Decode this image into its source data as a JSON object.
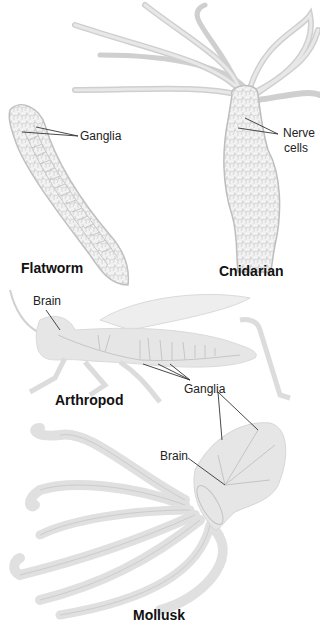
{
  "organisms": [
    {
      "name": "Flatworm",
      "labels": [
        "Ganglia"
      ]
    },
    {
      "name": "Cnidarian",
      "labels": [
        "Nerve",
        "cells"
      ]
    },
    {
      "name": "Arthropod",
      "labels": [
        "Brain",
        "Ganglia"
      ]
    },
    {
      "name": "Mollusk",
      "labels": [
        "Brain"
      ]
    }
  ],
  "flatworm": {
    "title": "Flatworm",
    "ganglia_label": "Ganglia"
  },
  "cnidarian": {
    "title": "Cnidarian",
    "nerve_label_line1": "Nerve",
    "nerve_label_line2": "cells"
  },
  "arthropod": {
    "title": "Arthropod",
    "brain_label": "Brain",
    "ganglia_label": "Ganglia"
  },
  "mollusk": {
    "title": "Mollusk",
    "brain_label": "Brain"
  },
  "colors": {
    "body_fill": "#e6e6e6",
    "outline": "#bdbdbd",
    "nerve": "#c4c4c4",
    "leader_line": "#333333",
    "text": "#222222"
  }
}
